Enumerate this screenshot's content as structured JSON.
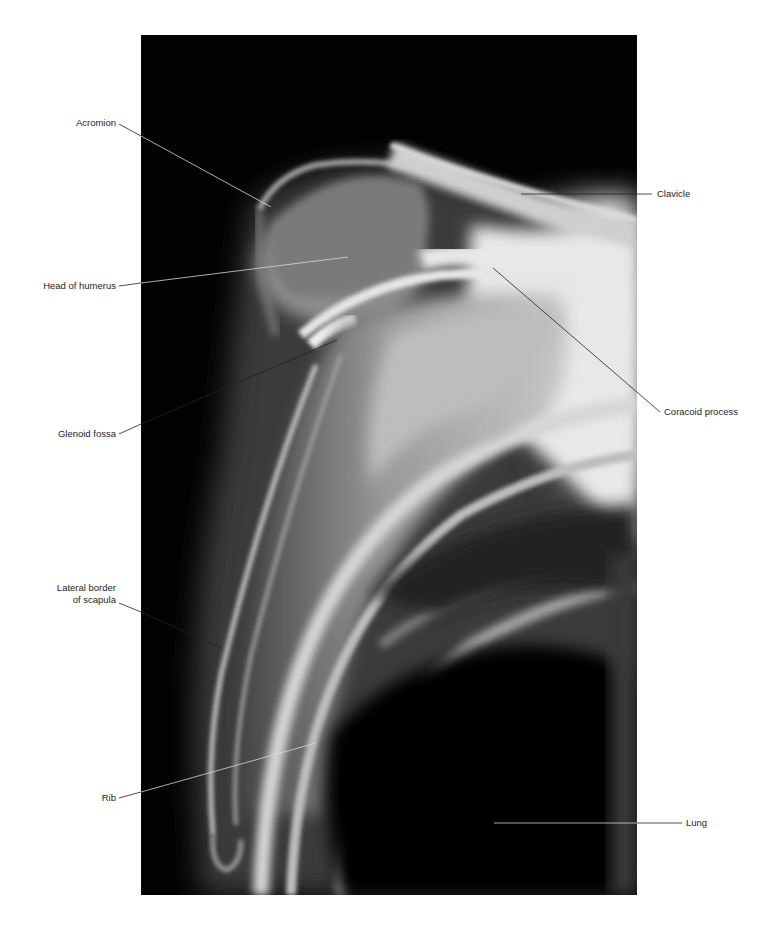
{
  "figure": {
    "xray_bounds": {
      "left": 141,
      "top": 35,
      "width": 496,
      "height": 860
    },
    "leader_color": "#1a1a1a",
    "leader_color_on_dark": "#d8d8d8"
  },
  "labels": {
    "left": [
      {
        "id": "acromion",
        "text": "Acromion",
        "line1": "Acromion",
        "line2": ""
      },
      {
        "id": "head-of-humerus",
        "text": "Head of humerus",
        "line1": "Head of humerus",
        "line2": ""
      },
      {
        "id": "glenoid-fossa",
        "text": "Glenoid fossa",
        "line1": "Glenoid fossa",
        "line2": ""
      },
      {
        "id": "lateral-border-of-scapula",
        "text": "Lateral border of scapula",
        "line1": "Lateral border",
        "line2": "of scapula"
      },
      {
        "id": "rib",
        "text": "Rib",
        "line1": "Rib",
        "line2": ""
      }
    ],
    "right": [
      {
        "id": "clavicle",
        "text": "Clavicle"
      },
      {
        "id": "coracoid-process",
        "text": "Coracoid process"
      },
      {
        "id": "lung",
        "text": "Lung"
      }
    ]
  }
}
